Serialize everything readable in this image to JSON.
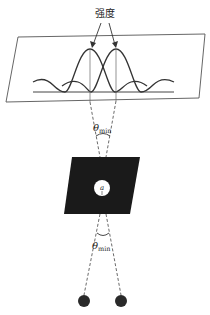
{
  "diagram": {
    "title_label": "强度",
    "aperture_label": "a",
    "angle_top": {
      "symbol": "θ",
      "subscript": "min"
    },
    "angle_bottom": {
      "symbol": "θ",
      "subscript": "min"
    },
    "colors": {
      "line": "#444444",
      "plate": "#1a1a1a",
      "dots": "#2a2a2a",
      "background": "#ffffff"
    },
    "elements": [
      "intensity-screen",
      "diffraction-pattern-left",
      "diffraction-pattern-right",
      "circular-aperture-plate",
      "point-source-left",
      "point-source-right"
    ]
  }
}
